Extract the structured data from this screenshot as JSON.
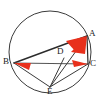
{
  "figure": {
    "type": "euclidean-geometry",
    "canvas": {
      "width": 102,
      "height": 100
    },
    "colors": {
      "stroke": "#3a3a3a",
      "chord_stroke": "#2b2b2b",
      "angle_fill": "#e8301c",
      "label": "#1a1a1a",
      "background": "#ffffff"
    },
    "circle": {
      "cx": 50,
      "cy": 52,
      "r": 41,
      "stroke_width": 1
    },
    "points": [
      {
        "id": "A",
        "label": "A",
        "x": 87,
        "y": 36,
        "label_x": 89,
        "label_y": 30,
        "on_circle": true
      },
      {
        "id": "B",
        "label": "B",
        "x": 14,
        "y": 63,
        "label_x": 3,
        "label_y": 57,
        "on_circle": true
      },
      {
        "id": "C",
        "label": "C",
        "x": 88,
        "y": 64,
        "label_x": 90,
        "label_y": 60,
        "on_circle": true
      },
      {
        "id": "D",
        "label": "D",
        "x": 64,
        "y": 58,
        "label_x": 57,
        "label_y": 47,
        "on_circle": false
      },
      {
        "id": "E",
        "label": "E",
        "x": 50,
        "y": 87,
        "label_x": 47,
        "label_y": 87,
        "on_circle": true
      }
    ],
    "segments": [
      {
        "id": "BA",
        "from": "B",
        "to": "A",
        "style": "solid",
        "width": 1.4
      },
      {
        "id": "BC",
        "from": "B",
        "to": "C",
        "style": "solid",
        "width": 1.2
      },
      {
        "id": "AC",
        "from": "A",
        "to": "C",
        "style": "solid",
        "width": 1.2
      },
      {
        "id": "AE",
        "from": "A",
        "to": "E",
        "style": "solid",
        "width": 1.0
      },
      {
        "id": "BE",
        "from": "B",
        "to": "E",
        "style": "solid",
        "width": 1.0
      },
      {
        "id": "CE",
        "from": "C",
        "to": "E",
        "style": "solid",
        "width": 1.0
      },
      {
        "id": "DE",
        "from": "D",
        "to": "E",
        "style": "solid",
        "width": 1.0
      }
    ],
    "angle_marks": [
      {
        "id": "angle-A-1",
        "vertex": "A",
        "fill": "#e8301c",
        "points": "87,36 66,41 75,51"
      },
      {
        "id": "angle-A-2",
        "vertex": "A",
        "fill": "#e8301c",
        "points": "87,36 71,52 84,53"
      },
      {
        "id": "angle-B",
        "vertex": "B",
        "fill": "#e8301c",
        "points": "14,63 30,63 28,70"
      },
      {
        "id": "angle-C",
        "vertex": "C",
        "fill": "#e8301c",
        "points": "88,64 72,60 74,67"
      }
    ]
  }
}
